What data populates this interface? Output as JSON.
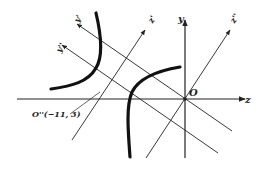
{
  "figure": {
    "axes": {
      "x_label": "z",
      "y_label": "y",
      "origin_label": "O"
    },
    "rotated_axes": {
      "primary_label": "z'",
      "primary_label_2": "z''",
      "secondary_label": "y'",
      "secondary_label_2": "y''"
    },
    "translated_origin_label": "O''(−11, 3)",
    "colors": {
      "ink": "#222222",
      "background": "#ffffff"
    }
  }
}
